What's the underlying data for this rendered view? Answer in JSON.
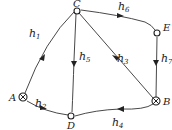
{
  "diagram": {
    "type": "directed-graph",
    "nodes": [
      {
        "id": "A",
        "label": "A",
        "symbol": "crossed-circle"
      },
      {
        "id": "B",
        "label": "B",
        "symbol": "crossed-circle"
      },
      {
        "id": "C",
        "label": "C",
        "symbol": "open-circle"
      },
      {
        "id": "D",
        "label": "D",
        "symbol": "open-circle"
      },
      {
        "id": "E",
        "label": "E",
        "symbol": "open-circle"
      }
    ],
    "edges": [
      {
        "from": "A",
        "to": "C",
        "label": "h",
        "sub": "1"
      },
      {
        "from": "A",
        "to": "D",
        "label": "h",
        "sub": "2"
      },
      {
        "from": "B",
        "to": "C",
        "label": "h",
        "sub": "3"
      },
      {
        "from": "B",
        "to": "D",
        "label": "h",
        "sub": "4"
      },
      {
        "from": "C",
        "to": "D",
        "label": "h",
        "sub": "5"
      },
      {
        "from": "C",
        "to": "E",
        "label": "h",
        "sub": "6"
      },
      {
        "from": "E",
        "to": "B",
        "label": "h",
        "sub": "7"
      }
    ]
  }
}
